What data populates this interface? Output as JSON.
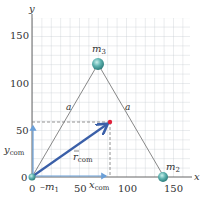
{
  "figure": {
    "axes": {
      "x_label": "x",
      "y_label": "y",
      "x_ticks": [
        "0",
        "50",
        "100",
        "150"
      ],
      "y_ticks": [
        "0",
        "50",
        "100",
        "150"
      ],
      "x_range": [
        0,
        165
      ],
      "y_range": [
        0,
        170
      ],
      "grid_step": 10
    },
    "masses": [
      {
        "label": "m",
        "sub": "1",
        "x": 0,
        "y": 0
      },
      {
        "label": "m",
        "sub": "2",
        "x": 140,
        "y": 0
      },
      {
        "label": "m",
        "sub": "3",
        "x": 70,
        "y": 120
      }
    ],
    "sides": [
      {
        "label": "a"
      },
      {
        "label": "a"
      }
    ],
    "center_of_mass": {
      "x": 83,
      "y": 58
    },
    "vector_label": "r",
    "vector_sub": "com",
    "x_com_label": "x",
    "x_com_sub": "com",
    "y_com_label": "y",
    "y_com_sub": "com",
    "colors": {
      "grid": "#b8bec6",
      "axes": "#555555",
      "vector": "#3a5fa8",
      "axis_projection": "#6a9fd8",
      "mass": "#5fb3b0",
      "com_dot": "#e0203a",
      "triangle": "#555555"
    }
  }
}
